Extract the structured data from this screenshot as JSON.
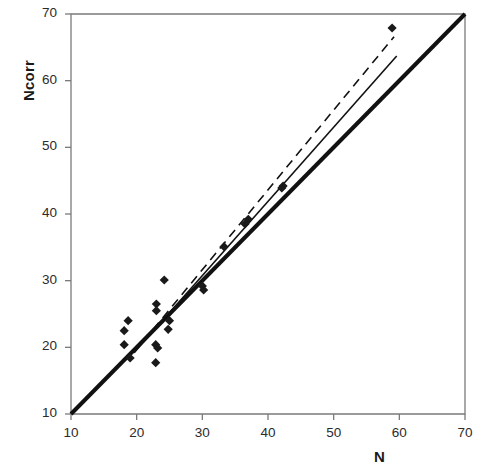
{
  "chart_data": {
    "type": "scatter",
    "title": "",
    "xlabel": "N",
    "ylabel": "Ncorr",
    "xlim": [
      10,
      70
    ],
    "ylim": [
      10,
      70
    ],
    "xticks": [
      10,
      20,
      30,
      40,
      50,
      60,
      70
    ],
    "yticks": [
      10,
      20,
      30,
      40,
      50,
      60,
      70
    ],
    "grid": false,
    "legend": "none",
    "series": [
      {
        "name": "data-points",
        "marker": "diamond",
        "color": "#1a1a1a",
        "points": [
          [
            18.1,
            22.5
          ],
          [
            18.1,
            20.4
          ],
          [
            18.7,
            24.0
          ],
          [
            19.0,
            18.4
          ],
          [
            22.9,
            20.4
          ],
          [
            22.9,
            17.7
          ],
          [
            23.0,
            26.5
          ],
          [
            23.0,
            25.5
          ],
          [
            23.2,
            19.9
          ],
          [
            24.2,
            30.1
          ],
          [
            25.0,
            24.0
          ],
          [
            24.8,
            22.7
          ],
          [
            30.0,
            29.2
          ],
          [
            30.2,
            28.6
          ],
          [
            33.3,
            35.1
          ],
          [
            36.5,
            38.5
          ],
          [
            37.0,
            39.2
          ],
          [
            42.1,
            43.9
          ],
          [
            42.3,
            44.2
          ],
          [
            58.9,
            67.9
          ]
        ]
      }
    ],
    "lines": [
      {
        "name": "identity-line",
        "style": "solid",
        "width": 4,
        "color": "#111111",
        "from": [
          10,
          10
        ],
        "to": [
          70,
          70
        ],
        "label": "1:1 line"
      },
      {
        "name": "regression-line",
        "style": "solid",
        "width": 1.6,
        "color": "#111111",
        "from": [
          19.6,
          19.2
        ],
        "to": [
          59.6,
          63.7
        ],
        "label": "regression fit"
      },
      {
        "name": "regression-line-dashed",
        "style": "dashed",
        "width": 1.6,
        "color": "#111111",
        "from": [
          19.6,
          19.2
        ],
        "to": [
          59.2,
          66.6
        ],
        "label": "alternate fit"
      }
    ]
  },
  "axes": {
    "x": {
      "label": "N",
      "ticks": [
        "10",
        "20",
        "30",
        "40",
        "50",
        "60",
        "70"
      ]
    },
    "y": {
      "label": "Ncorr",
      "ticks": [
        "10",
        "20",
        "30",
        "40",
        "50",
        "60",
        "70"
      ]
    }
  }
}
